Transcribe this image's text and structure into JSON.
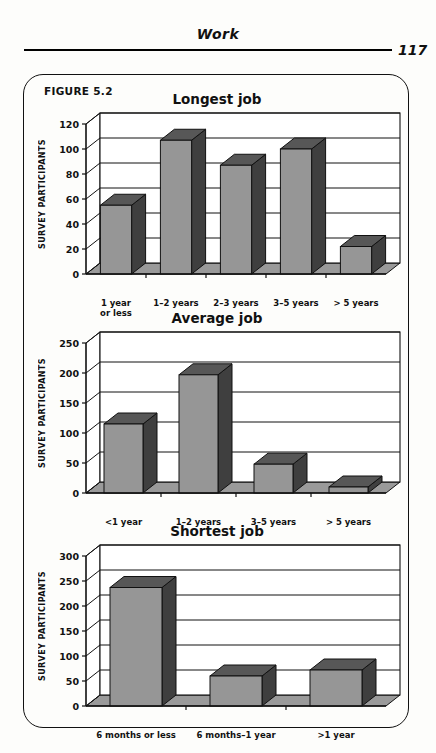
{
  "header": {
    "title": "Work",
    "page_number": "117"
  },
  "figure": {
    "label": "FIGURE 5.2"
  },
  "axis": {
    "ylabel": "SURVEY PARTICIPANTS"
  },
  "chart_data": [
    {
      "type": "bar",
      "title": "Longest job",
      "xlabel": "",
      "ylabel": "SURVEY PARTICIPANTS",
      "categories": [
        "1 year\nor less",
        "1–2 years",
        "2–3 years",
        "3–5 years",
        "> 5 years"
      ],
      "values": [
        55,
        107,
        87,
        100,
        22
      ],
      "ylim": [
        0,
        120
      ],
      "yticks": [
        0,
        20,
        40,
        60,
        80,
        100,
        120
      ],
      "grid": true,
      "legend": "none",
      "style": "3d-column",
      "bar_face_color": "#969696",
      "bar_side_color": "#3f3f3f",
      "bar_top_color": "#575757"
    },
    {
      "type": "bar",
      "title": "Average job",
      "xlabel": "",
      "ylabel": "SURVEY PARTICIPANTS",
      "categories": [
        "<1 year",
        "1–2 years",
        "3–5 years",
        "> 5 years"
      ],
      "values": [
        115,
        197,
        48,
        10
      ],
      "ylim": [
        0,
        250
      ],
      "yticks": [
        0,
        50,
        100,
        150,
        200,
        250
      ],
      "grid": true,
      "legend": "none",
      "style": "3d-column",
      "bar_face_color": "#969696",
      "bar_side_color": "#3f3f3f",
      "bar_top_color": "#575757"
    },
    {
      "type": "bar",
      "title": "Shortest job",
      "xlabel": "",
      "ylabel": "SURVEY PARTICIPANTS",
      "categories": [
        "6  months or less",
        "6  months–1 year",
        ">1 year"
      ],
      "values": [
        237,
        60,
        72
      ],
      "ylim": [
        0,
        300
      ],
      "yticks": [
        0,
        50,
        100,
        150,
        200,
        250,
        300
      ],
      "grid": true,
      "legend": "none",
      "style": "3d-column",
      "bar_face_color": "#969696",
      "bar_side_color": "#3f3f3f",
      "bar_top_color": "#575757"
    }
  ]
}
